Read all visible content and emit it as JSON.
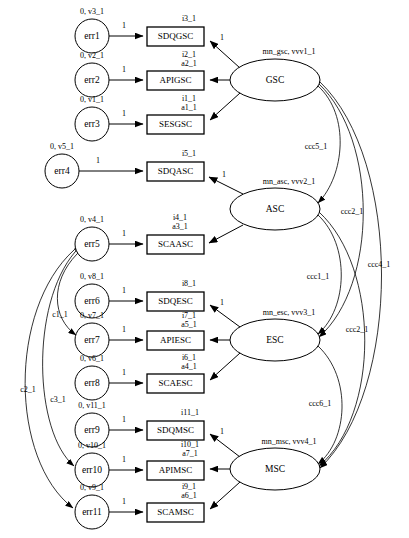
{
  "diagram": {
    "type": "sem-path-diagram",
    "width": 409,
    "height": 538,
    "fixed_loading_label": "1",
    "error_mean_prefix": "0",
    "latent_factors": [
      {
        "id": "gsc",
        "label": "GSC",
        "param_label": "mn_gsc, vvv1_1",
        "cx": 275,
        "cy": 80,
        "rx": 45,
        "ry": 21
      },
      {
        "id": "asc",
        "label": "ASC",
        "param_label": "mn_asc, vvv2_1",
        "cx": 275,
        "cy": 209,
        "rx": 45,
        "ry": 21
      },
      {
        "id": "esc",
        "label": "ESC",
        "param_label": "mn_esc, vvv3_1",
        "cx": 275,
        "cy": 340,
        "rx": 45,
        "ry": 21
      },
      {
        "id": "msc",
        "label": "MSC",
        "param_label": "mn_msc, vvv4_1",
        "cx": 275,
        "cy": 469,
        "rx": 45,
        "ry": 21
      }
    ],
    "indicators": [
      {
        "id": "sdqgsc",
        "label": "SDQGSC",
        "factor": "gsc",
        "intercept": "i3_1",
        "loading": "",
        "fixed": "1",
        "x": 147,
        "y": 27,
        "w": 57,
        "h": 19
      },
      {
        "id": "apigsc",
        "label": "APIGSC",
        "factor": "gsc",
        "intercept": "i2_1",
        "loading": "a2_1",
        "fixed": "",
        "x": 147,
        "y": 71,
        "w": 57,
        "h": 19
      },
      {
        "id": "sesgsc",
        "label": "SESGSC",
        "factor": "gsc",
        "intercept": "i1_1",
        "loading": "a1_1",
        "fixed": "",
        "x": 147,
        "y": 115,
        "w": 57,
        "h": 19
      },
      {
        "id": "sdqasc",
        "label": "SDQASC",
        "factor": "asc",
        "intercept": "i5_1",
        "loading": "",
        "fixed": "1",
        "x": 147,
        "y": 162,
        "w": 57,
        "h": 19
      },
      {
        "id": "scaasc",
        "label": "SCAASC",
        "factor": "asc",
        "intercept": "i4_1",
        "loading": "a3_1",
        "fixed": "",
        "x": 147,
        "y": 235,
        "w": 57,
        "h": 19
      },
      {
        "id": "sdqesc",
        "label": "SDQESC",
        "factor": "esc",
        "intercept": "i8_1",
        "loading": "",
        "fixed": "1",
        "x": 147,
        "y": 292,
        "w": 57,
        "h": 19
      },
      {
        "id": "apiesc",
        "label": "APIESC",
        "factor": "esc",
        "intercept": "i7_1",
        "loading": "a5_1",
        "fixed": "",
        "x": 147,
        "y": 331,
        "w": 57,
        "h": 19
      },
      {
        "id": "scaesc",
        "label": "SCAESC",
        "factor": "esc",
        "intercept": "i6_1",
        "loading": "a4_1",
        "fixed": "",
        "x": 147,
        "y": 374,
        "w": 57,
        "h": 19
      },
      {
        "id": "sdqmsc",
        "label": "SDQMSC",
        "factor": "msc",
        "intercept": "i11_1",
        "loading": "",
        "fixed": "1",
        "x": 147,
        "y": 421,
        "w": 57,
        "h": 19
      },
      {
        "id": "apimsc",
        "label": "APIMSC",
        "factor": "msc",
        "intercept": "i10_1",
        "loading": "a7_1",
        "fixed": "",
        "x": 147,
        "y": 461,
        "w": 57,
        "h": 19
      },
      {
        "id": "scamsc",
        "label": "SCAMSC",
        "factor": "msc",
        "intercept": "i9_1",
        "loading": "a6_1",
        "fixed": "",
        "x": 147,
        "y": 503,
        "w": 57,
        "h": 19
      }
    ],
    "errors": [
      {
        "id": "err1",
        "label": "err1",
        "param_label": "0, v3_1",
        "path_label": "1",
        "target": "sdqgsc",
        "cx": 92,
        "cy": 36,
        "r": 17
      },
      {
        "id": "err2",
        "label": "err2",
        "param_label": "0, v2_1",
        "path_label": "1",
        "target": "apigsc",
        "cx": 92,
        "cy": 80,
        "r": 17
      },
      {
        "id": "err3",
        "label": "err3",
        "param_label": "0, v1_1",
        "path_label": "1",
        "target": "sesgsc",
        "cx": 92,
        "cy": 124,
        "r": 17
      },
      {
        "id": "err4",
        "label": "err4",
        "param_label": "0, v5_1",
        "path_label": "1",
        "target": "sdqasc",
        "cx": 62,
        "cy": 171,
        "r": 17
      },
      {
        "id": "err5",
        "label": "err5",
        "param_label": "0, v4_1",
        "path_label": "1",
        "target": "scaasc",
        "cx": 92,
        "cy": 244,
        "r": 17
      },
      {
        "id": "err6",
        "label": "err6",
        "param_label": "0, v8_1",
        "path_label": "1",
        "target": "sdqesc",
        "cx": 92,
        "cy": 301,
        "r": 17
      },
      {
        "id": "err7",
        "label": "err7",
        "param_label": "0, v7_1",
        "path_label": "1",
        "target": "apiesc",
        "cx": 92,
        "cy": 340,
        "r": 17
      },
      {
        "id": "err8",
        "label": "err8",
        "param_label": "0, v6_1",
        "path_label": "1",
        "target": "scaesc",
        "cx": 92,
        "cy": 383,
        "r": 17
      },
      {
        "id": "err9",
        "label": "err9",
        "param_label": "0, v11_1",
        "path_label": "1",
        "target": "sdqmsc",
        "cx": 92,
        "cy": 430,
        "r": 17
      },
      {
        "id": "err10",
        "label": "err10",
        "param_label": "0, v10_1",
        "path_label": "1",
        "target": "apimsc",
        "cx": 92,
        "cy": 470,
        "r": 17
      },
      {
        "id": "err11",
        "label": "err11",
        "param_label": "0, v9_1",
        "path_label": "1",
        "target": "scamsc",
        "cx": 92,
        "cy": 512,
        "r": 17
      }
    ],
    "factor_covariances": [
      {
        "id": "ccc5_1",
        "label": "ccc5_1",
        "from": "gsc",
        "to": "asc",
        "lx": 316,
        "ly": 147
      },
      {
        "id": "ccc1_1",
        "label": "ccc1_1",
        "from": "asc",
        "to": "esc",
        "lx": 318,
        "ly": 277
      },
      {
        "id": "ccc6_1",
        "label": "ccc6_1",
        "from": "esc",
        "to": "msc",
        "lx": 320,
        "ly": 404
      },
      {
        "id": "ccc2_1_upper",
        "label": "ccc2_1",
        "from": "gsc",
        "to": "esc",
        "lx": 352,
        "ly": 212
      },
      {
        "id": "ccc2_1_lower",
        "label": "ccc2_1",
        "from": "asc",
        "to": "msc",
        "lx": 357,
        "ly": 330
      },
      {
        "id": "ccc4_1",
        "label": "ccc4_1",
        "from": "gsc",
        "to": "msc",
        "lx": 379,
        "ly": 265
      }
    ],
    "error_covariances": [
      {
        "id": "c1_1",
        "label": "c1_1",
        "from": "err5",
        "to": "err7",
        "lx": 60,
        "ly": 315
      },
      {
        "id": "c3_1",
        "label": "c3_1",
        "from": "err5",
        "to": "err10",
        "lx": 58,
        "ly": 400
      },
      {
        "id": "c2_1",
        "label": "c2_1",
        "from": "err5",
        "to": "err11",
        "lx": 28,
        "ly": 390
      }
    ]
  }
}
